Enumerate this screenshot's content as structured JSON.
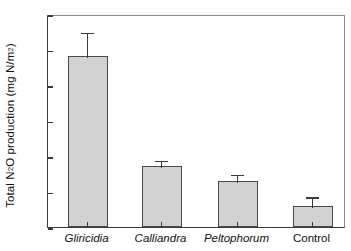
{
  "chart_data": {
    "type": "bar",
    "title": "",
    "xlabel": "",
    "ylabel": "Total N2O production (mg N/m2)",
    "ylabel_parts": {
      "pre": "Total N",
      "sub": "2",
      "mid": "O production (mg N/m",
      "sup": "2",
      "post": ")"
    },
    "categories": [
      "Gliricidia",
      "Calliandra",
      "Peltophorum",
      "Control"
    ],
    "categories_italic": [
      true,
      true,
      true,
      false
    ],
    "values": [
      9.65,
      3.45,
      2.6,
      1.2
    ],
    "errors_upper": [
      1.35,
      0.35,
      0.4,
      0.55
    ],
    "values_upper": [
      11.0,
      3.8,
      3.0,
      1.75
    ],
    "ylim": [
      0,
      12
    ],
    "ytick_values": [
      0,
      2,
      4,
      6,
      8,
      10,
      12
    ],
    "ytick_labels": [
      "0",
      "2",
      "4",
      "6",
      "8",
      "10",
      "12"
    ],
    "grid": false,
    "legend": null,
    "bar_color": "#d2d2d2",
    "bar_edge_color": "#4a4a4a",
    "axis_color": "#3a3a3a",
    "error_bar_direction": "upper-only"
  }
}
